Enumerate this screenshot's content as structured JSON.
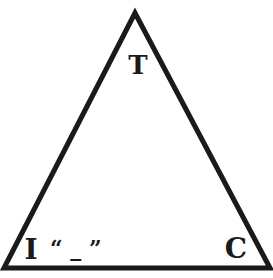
{
  "diagram": {
    "shape": "triangle",
    "stroke_color": "#1a1a1a",
    "background": "#ffffff",
    "vertices": {
      "top": {
        "label": "T"
      },
      "bottom_left": {
        "label": "I",
        "annotation": "“ _ ”"
      },
      "bottom_right": {
        "label": "C"
      }
    }
  }
}
